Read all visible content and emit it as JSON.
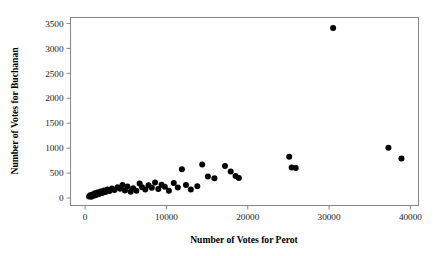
{
  "chart_data": {
    "type": "scatter",
    "title": "",
    "xlabel": "Number of Votes for Perot",
    "ylabel": "Number of Votes for Buchanan",
    "xlim": [
      -1800,
      41000
    ],
    "ylim": [
      -150,
      3620
    ],
    "xticks": [
      0,
      10000,
      20000,
      30000,
      40000
    ],
    "xticklabels": [
      "0",
      "10000",
      "20000",
      "30000",
      "40000"
    ],
    "yticks": [
      0,
      500,
      1000,
      1500,
      2000,
      2500,
      3000,
      3500
    ],
    "yticklabels": [
      "0",
      "500",
      "1000",
      "1500",
      "2000",
      "2500",
      "3000",
      "3500"
    ],
    "grid": false,
    "legend": null,
    "marker": {
      "shape": "circle",
      "color": "#000000",
      "radius_px": 3.0
    },
    "points": [
      {
        "x": 480,
        "y": 30
      },
      {
        "x": 620,
        "y": 55
      },
      {
        "x": 760,
        "y": 25
      },
      {
        "x": 900,
        "y": 70
      },
      {
        "x": 1050,
        "y": 45
      },
      {
        "x": 1200,
        "y": 95
      },
      {
        "x": 1350,
        "y": 60
      },
      {
        "x": 1500,
        "y": 110
      },
      {
        "x": 1700,
        "y": 80
      },
      {
        "x": 1900,
        "y": 130
      },
      {
        "x": 2100,
        "y": 100
      },
      {
        "x": 2300,
        "y": 150
      },
      {
        "x": 2500,
        "y": 120
      },
      {
        "x": 2750,
        "y": 170
      },
      {
        "x": 3000,
        "y": 140
      },
      {
        "x": 3300,
        "y": 190
      },
      {
        "x": 3600,
        "y": 160
      },
      {
        "x": 4000,
        "y": 215
      },
      {
        "x": 4300,
        "y": 185
      },
      {
        "x": 4600,
        "y": 260
      },
      {
        "x": 4900,
        "y": 150
      },
      {
        "x": 5200,
        "y": 230
      },
      {
        "x": 5600,
        "y": 125
      },
      {
        "x": 5900,
        "y": 195
      },
      {
        "x": 6300,
        "y": 145
      },
      {
        "x": 6700,
        "y": 290
      },
      {
        "x": 7000,
        "y": 215
      },
      {
        "x": 7400,
        "y": 170
      },
      {
        "x": 7800,
        "y": 255
      },
      {
        "x": 8200,
        "y": 205
      },
      {
        "x": 8600,
        "y": 310
      },
      {
        "x": 9000,
        "y": 180
      },
      {
        "x": 9400,
        "y": 265
      },
      {
        "x": 9800,
        "y": 225
      },
      {
        "x": 10300,
        "y": 145
      },
      {
        "x": 10900,
        "y": 300
      },
      {
        "x": 11400,
        "y": 210
      },
      {
        "x": 11900,
        "y": 575
      },
      {
        "x": 12400,
        "y": 260
      },
      {
        "x": 13000,
        "y": 170
      },
      {
        "x": 13800,
        "y": 235
      },
      {
        "x": 14400,
        "y": 670
      },
      {
        "x": 15100,
        "y": 430
      },
      {
        "x": 15900,
        "y": 395
      },
      {
        "x": 17200,
        "y": 640
      },
      {
        "x": 17900,
        "y": 530
      },
      {
        "x": 18500,
        "y": 440
      },
      {
        "x": 18900,
        "y": 400
      },
      {
        "x": 25100,
        "y": 830
      },
      {
        "x": 25400,
        "y": 610
      },
      {
        "x": 25900,
        "y": 600
      },
      {
        "x": 30500,
        "y": 3410
      },
      {
        "x": 37300,
        "y": 1010
      },
      {
        "x": 38900,
        "y": 790
      }
    ],
    "outlier_note": "one point far above the trend near (30500, 3410)",
    "n_points": 54
  },
  "figure": {
    "background_color": "#ffffff",
    "frame_color": "#8a8a8a",
    "text_color": "#1a1a1a"
  }
}
